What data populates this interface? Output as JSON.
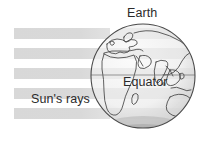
{
  "diagram": {
    "background_color": "#ffffff",
    "width": 200,
    "height": 142
  },
  "labels": {
    "earth": "Earth",
    "equator": "Equator",
    "suns_rays": "Sun's rays"
  },
  "colors": {
    "text": "#2b2b2b",
    "ray_band": "#d9d9d9",
    "globe_fill": "#f2f2f2",
    "globe_outline": "#4a4a4a",
    "coastline": "#3a3a3a",
    "equator_line": "#6e6e6e",
    "shadow": "#b5b5b5"
  },
  "suns_rays": {
    "count": 5,
    "band_left_x": 14,
    "band_right_x": 110,
    "band_height": 11,
    "band_spacing": 20,
    "band_top_ys": [
      28,
      48,
      68,
      88,
      108
    ],
    "direction": "left-to-right, horizontal"
  },
  "globe": {
    "center_x": 143,
    "center_y": 76,
    "radius": 52,
    "equator_line_y": 75,
    "continents_visible": [
      "Europe",
      "Africa",
      "Asia",
      "Australia",
      "Arabia",
      "India"
    ]
  }
}
